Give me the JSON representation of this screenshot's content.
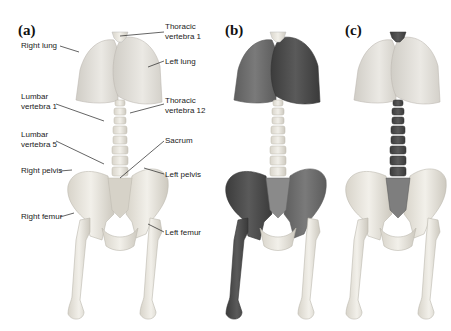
{
  "figure": {
    "panels": [
      {
        "id": "a",
        "label": "(a)"
      },
      {
        "id": "b",
        "label": "(b)"
      },
      {
        "id": "c",
        "label": "(c)"
      }
    ],
    "annotations": {
      "right_lung": "Right lung",
      "thoracic_vertebra_1": "Thoracic\nvertebra 1",
      "left_lung": "Left lung",
      "lumbar_vertebra_1": "Lumbar\nvertebra 1",
      "thoracic_vertebra_12": "Thoracic\nvertebra 12",
      "lumbar_vertebra_5": "Lumbar\nvertebra 5",
      "sacrum": "Sacrum",
      "right_pelvis": "Right pelvis",
      "left_pelvis": "Left pelvis",
      "right_femur": "Right femur",
      "left_femur": "Left femur"
    },
    "colors": {
      "bone_light": "#ece9e0",
      "bone_shade": "#cfcbc0",
      "lung_light": "#e4e2dc",
      "lung_shade": "#c9c6bf",
      "highlight_dark": "#4a4a4a",
      "highlight_mid": "#6a6a6a"
    }
  }
}
